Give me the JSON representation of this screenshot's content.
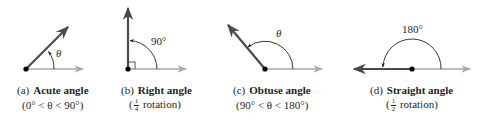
{
  "colors": {
    "ray_dark": "#4a4a4a",
    "ray_light": "#a7a9ac",
    "vertex": "#000000",
    "arc": "#231f20",
    "text": "#231f20"
  },
  "panels": [
    {
      "id": "a",
      "tag": "(a)",
      "title": "Acute angle",
      "subtitle": "(0° < θ < 90°)",
      "angle_label": "θ"
    },
    {
      "id": "b",
      "tag": "(b)",
      "title": "Right angle",
      "subtitle_open": "(",
      "fraction_num": "1",
      "fraction_den": "4",
      "subtitle_rest": " rotation)",
      "angle_label": "90°"
    },
    {
      "id": "c",
      "tag": "(c)",
      "title": "Obtuse angle",
      "subtitle": "(90° < θ < 180°)",
      "angle_label": "θ"
    },
    {
      "id": "d",
      "tag": "(d)",
      "title": "Straight angle",
      "subtitle_open": "(",
      "fraction_num": "1",
      "fraction_den": "2",
      "subtitle_rest": " rotation)",
      "angle_label": "180°"
    }
  ]
}
